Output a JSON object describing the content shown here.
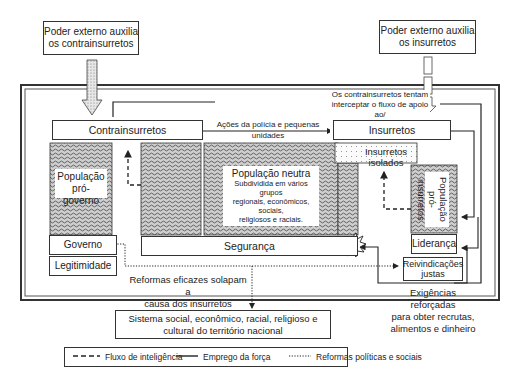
{
  "external_support": {
    "counterinsurgents_box": [
      "Poder externo auxilia",
      "os contrainsurretos"
    ],
    "insurgents_box": [
      "Poder externo auxilia",
      "os insurretos"
    ]
  },
  "interception_note": [
    "Os contrainsurretos tentam",
    "interceptar o fluxo de apoio ao/",
    "ou dentro do território nacional."
  ],
  "actors": {
    "counterinsurgents": "Contrainsurretos",
    "insurgents": "Insurretos",
    "isolated_insurgents": "Insurretos isolados"
  },
  "police_actions": "Ações da polícia e pequenas unidades",
  "populations": {
    "pro_government": [
      "População",
      "pró-governo"
    ],
    "neutral_title": "População neutra",
    "neutral_desc": [
      "Subdividida em vários grupos",
      "regionais, econômicos, sociais,",
      "religiosos e raciais."
    ],
    "pro_insurgent": [
      "População",
      "pró-insurretos"
    ]
  },
  "government": "Governo",
  "legitimacy": "Legitimidade",
  "security": "Segurança",
  "leadership": "Liderança",
  "just_grievances": [
    "Reivindicações",
    "justas"
  ],
  "reforms_note": [
    "Reformas eficazes solapam a",
    "causa dos insurretos"
  ],
  "reinforced_demands": [
    "Exigências reforçadas",
    "para obter recrutas,",
    "alimentos e dinheiro"
  ],
  "national_system": [
    "Sistema social, econômico, racial, religioso e",
    "cultural do território nacional"
  ],
  "legend": {
    "items": [
      {
        "style": "dashed",
        "label": "Fluxo de inteligência"
      },
      {
        "style": "solid",
        "label": "Emprego da força"
      },
      {
        "style": "dotted",
        "label": "Reformas políticas e sociais"
      }
    ]
  },
  "colors": {
    "line": "#222222",
    "hatch": "#555555",
    "dots": "#888888"
  }
}
